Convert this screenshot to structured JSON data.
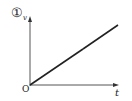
{
  "diagram": {
    "index_label": "①",
    "y_axis_label": "v",
    "x_axis_label": "t",
    "origin_label": "O",
    "graph_type": "v-t linear increasing from origin",
    "line_color": "#222222",
    "axis_color": "#444444"
  }
}
